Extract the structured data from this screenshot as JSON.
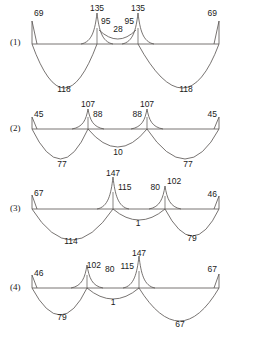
{
  "figure": {
    "title": "",
    "background": "#ffffff",
    "line_color": "#55504e",
    "text_color": "#1a1a1a",
    "width": 255,
    "height": 337
  },
  "chart_data": {
    "type": "line",
    "title": "",
    "subtitle": "",
    "xlabel": "",
    "ylabel": "",
    "grid": false,
    "legend": false,
    "xlim": [
      0,
      255
    ],
    "diagrams": [
      {
        "label": "(1)",
        "label_x": 10,
        "label_y": 45,
        "baseline_y": 44,
        "x_start": 32,
        "x_end": 219,
        "supports": [
          32,
          97,
          138,
          219
        ],
        "above_labels": [
          {
            "text": "69",
            "x": 34,
            "y": 16,
            "anchor": "start"
          },
          {
            "text": "135",
            "x": 97,
            "y": 11,
            "anchor": "middle"
          },
          {
            "text": "95",
            "x": 101,
            "y": 24,
            "anchor": "start"
          },
          {
            "text": "28",
            "x": 118,
            "y": 32,
            "anchor": "middle"
          },
          {
            "text": "95",
            "x": 134,
            "y": 24,
            "anchor": "end"
          },
          {
            "text": "135",
            "x": 138,
            "y": 11,
            "anchor": "middle"
          },
          {
            "text": "69",
            "x": 217,
            "y": 16,
            "anchor": "end"
          }
        ],
        "below_labels": [
          {
            "text": "118",
            "x": 64,
            "y": 92,
            "anchor": "middle"
          },
          {
            "text": "118",
            "x": 186,
            "y": 92,
            "anchor": "middle"
          }
        ],
        "values": [
          69,
          135,
          95,
          28,
          95,
          135,
          69,
          118,
          118
        ]
      },
      {
        "label": "(2)",
        "label_x": 10,
        "label_y": 131,
        "baseline_y": 129,
        "x_start": 32,
        "x_end": 219,
        "supports": [
          32,
          88,
          147,
          219
        ],
        "above_labels": [
          {
            "text": "45",
            "x": 34,
            "y": 117,
            "anchor": "start"
          },
          {
            "text": "107",
            "x": 88,
            "y": 107,
            "anchor": "middle"
          },
          {
            "text": "88",
            "x": 93,
            "y": 117,
            "anchor": "start"
          },
          {
            "text": "88",
            "x": 142,
            "y": 117,
            "anchor": "end"
          },
          {
            "text": "107",
            "x": 147,
            "y": 107,
            "anchor": "middle"
          },
          {
            "text": "45",
            "x": 217,
            "y": 117,
            "anchor": "end"
          }
        ],
        "below_labels": [
          {
            "text": "77",
            "x": 62,
            "y": 167,
            "anchor": "middle"
          },
          {
            "text": "10",
            "x": 118,
            "y": 155,
            "anchor": "middle"
          },
          {
            "text": "77",
            "x": 188,
            "y": 167,
            "anchor": "middle"
          }
        ],
        "values": [
          45,
          107,
          88,
          88,
          107,
          45,
          77,
          10,
          77
        ]
      },
      {
        "label": "(3)",
        "label_x": 10,
        "label_y": 211,
        "baseline_y": 209,
        "x_start": 32,
        "x_end": 219,
        "supports": [
          32,
          113,
          165,
          219
        ],
        "above_labels": [
          {
            "text": "67",
            "x": 34,
            "y": 196,
            "anchor": "start"
          },
          {
            "text": "147",
            "x": 113,
            "y": 176,
            "anchor": "middle"
          },
          {
            "text": "115",
            "x": 118,
            "y": 190,
            "anchor": "start"
          },
          {
            "text": "80",
            "x": 160,
            "y": 190,
            "anchor": "end"
          },
          {
            "text": "102",
            "x": 167,
            "y": 184,
            "anchor": "start"
          },
          {
            "text": "46",
            "x": 217,
            "y": 197,
            "anchor": "end"
          }
        ],
        "below_labels": [
          {
            "text": "114",
            "x": 71,
            "y": 244,
            "anchor": "middle"
          },
          {
            "text": "1",
            "x": 138,
            "y": 226,
            "anchor": "middle"
          },
          {
            "text": "79",
            "x": 192,
            "y": 241,
            "anchor": "middle"
          }
        ],
        "values": [
          67,
          147,
          115,
          80,
          102,
          46,
          114,
          1,
          79
        ]
      },
      {
        "label": "(4)",
        "label_x": 10,
        "label_y": 290,
        "baseline_y": 288,
        "x_start": 32,
        "x_end": 219,
        "supports": [
          32,
          87,
          139,
          219
        ],
        "above_labels": [
          {
            "text": "46",
            "x": 34,
            "y": 276,
            "anchor": "start"
          },
          {
            "text": "102",
            "x": 101,
            "y": 268,
            "anchor": "end"
          },
          {
            "text": "80",
            "x": 105,
            "y": 272,
            "anchor": "start"
          },
          {
            "text": "115",
            "x": 134,
            "y": 269,
            "anchor": "end"
          },
          {
            "text": "147",
            "x": 139,
            "y": 256,
            "anchor": "middle"
          },
          {
            "text": "67",
            "x": 217,
            "y": 272,
            "anchor": "end"
          }
        ],
        "below_labels": [
          {
            "text": "79",
            "x": 62,
            "y": 320,
            "anchor": "middle"
          },
          {
            "text": "1",
            "x": 113,
            "y": 305,
            "anchor": "middle"
          },
          {
            "text": "67",
            "x": 180,
            "y": 327,
            "anchor": "middle"
          }
        ],
        "values": [
          46,
          102,
          80,
          115,
          147,
          67,
          79,
          1
        ]
      }
    ]
  }
}
